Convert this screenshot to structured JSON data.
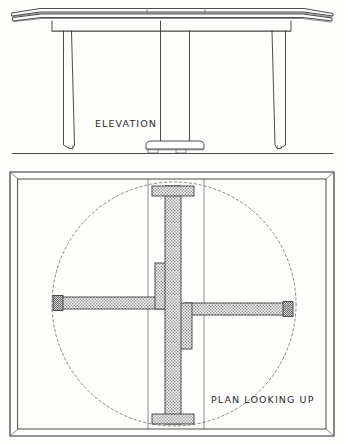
{
  "drawing": {
    "title": "Table Construction Drawing",
    "medium": "hand-drawn ink line drawing",
    "paper_color": "#fdfdfc",
    "ink_color": "#3a3a3a",
    "views": [
      {
        "id": "elevation",
        "label": "ELEVATION",
        "label_x": 95,
        "label_y": 127,
        "description": "Side elevation of table showing tabletop, two tapered outer legs and a central pedestal on a shaped foot block"
      },
      {
        "id": "plan",
        "label": "PLAN LOOKING UP",
        "label_x": 211,
        "label_y": 403,
        "description": "Underside plan of table showing cruciform stretcher frame in section hatch, dashed circle swing arc and two leaf joint lines"
      }
    ],
    "elevation_parts": [
      "tabletop",
      "tabletop-edge-profile",
      "apron",
      "left-leg",
      "right-leg",
      "center-pedestal",
      "pedestal-foot",
      "ground-line"
    ],
    "plan_parts": [
      "top-outline-border",
      "leaf-joint-line-left",
      "leaf-joint-line-right",
      "vertical-spine-beam",
      "top-flange",
      "bottom-flange",
      "left-arm",
      "right-arm",
      "left-arm-end-cap",
      "right-arm-end-cap",
      "center-block-upper",
      "center-block-lower",
      "swing-arc-circle"
    ]
  }
}
